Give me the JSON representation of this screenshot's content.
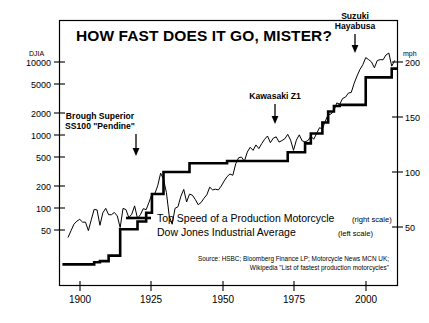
{
  "chart_data": {
    "type": "line",
    "title": "HOW FAST DOES IT GO, MISTER?",
    "xlabel": "",
    "ylabel": "DJIA",
    "y2label": "mph",
    "grid": false,
    "legend_position": "center",
    "x_ticks": [
      "1900",
      "1925",
      "1950",
      "1975",
      "2000"
    ],
    "x_tick_values": [
      1900,
      1925,
      1950,
      1975,
      2000
    ],
    "xlim": [
      1893,
      2010
    ],
    "left_axis": {
      "label": "DJIA",
      "scale": "log",
      "ylim": [
        30,
        13500
      ],
      "ticks": [
        "10000",
        "5000",
        "2000",
        "1000",
        "500",
        "200",
        "100",
        "50"
      ],
      "tick_values": [
        10000,
        5000,
        2000,
        1000,
        500,
        200,
        100,
        50
      ]
    },
    "right_axis": {
      "label": "mph",
      "scale": "linear",
      "ylim": [
        0,
        215
      ],
      "ticks": [
        "200",
        "150",
        "100",
        "50"
      ],
      "tick_values": [
        200,
        150,
        100,
        50
      ]
    },
    "series": [
      {
        "name": "Top Speed of a Production Motorcycle",
        "scale_ref": "right",
        "units": "mph",
        "style": "thick-step",
        "x": [
          1894,
          1900,
          1905,
          1907,
          1910,
          1912,
          1914,
          1920,
          1923,
          1925,
          1929,
          1936,
          1938,
          1949,
          1951,
          1969,
          1972,
          1973,
          1978,
          1980,
          1984,
          1986,
          1988,
          1990,
          1996,
          1999,
          2005,
          2008
        ],
        "values": [
          16,
          16,
          18,
          19,
          24,
          24,
          48,
          55,
          63,
          80,
          100,
          100,
          108,
          108,
          110,
          110,
          118,
          118,
          126,
          135,
          145,
          155,
          160,
          161,
          161,
          186,
          186,
          194
        ]
      },
      {
        "name": "Dow Jones Industrial Average",
        "scale_ref": "left",
        "units": "index",
        "style": "thin-line",
        "x": [
          1896,
          1897,
          1898,
          1899,
          1900,
          1901,
          1902,
          1903,
          1904,
          1905,
          1906,
          1907,
          1908,
          1909,
          1910,
          1911,
          1912,
          1913,
          1914,
          1915,
          1916,
          1917,
          1918,
          1919,
          1920,
          1921,
          1922,
          1923,
          1924,
          1925,
          1926,
          1927,
          1928,
          1929,
          1930,
          1931,
          1932,
          1933,
          1934,
          1935,
          1936,
          1937,
          1938,
          1939,
          1940,
          1941,
          1942,
          1943,
          1944,
          1945,
          1946,
          1947,
          1948,
          1949,
          1950,
          1951,
          1952,
          1953,
          1954,
          1955,
          1956,
          1957,
          1958,
          1959,
          1960,
          1961,
          1962,
          1963,
          1964,
          1965,
          1966,
          1967,
          1968,
          1969,
          1970,
          1971,
          1972,
          1973,
          1974,
          1975,
          1976,
          1977,
          1978,
          1979,
          1980,
          1981,
          1982,
          1983,
          1984,
          1985,
          1986,
          1987,
          1988,
          1989,
          1990,
          1991,
          1992,
          1993,
          1994,
          1995,
          1996,
          1997,
          1998,
          1999,
          2000,
          2001,
          2002,
          2003,
          2004,
          2005,
          2006,
          2007,
          2008,
          2009
        ],
        "values": [
          40,
          49,
          60,
          66,
          70,
          64,
          64,
          49,
          69,
          96,
          94,
          58,
          86,
          99,
          81,
          81,
          87,
          78,
          54,
          99,
          95,
          74,
          82,
          107,
          72,
          81,
          98,
          95,
          120,
          156,
          157,
          202,
          300,
          248,
          164,
          77,
          60,
          99,
          104,
          144,
          180,
          121,
          155,
          150,
          131,
          111,
          119,
          136,
          152,
          193,
          177,
          181,
          177,
          200,
          235,
          269,
          292,
          281,
          404,
          488,
          499,
          436,
          584,
          679,
          616,
          731,
          652,
          763,
          874,
          969,
          786,
          905,
          944,
          800,
          839,
          890,
          1020,
          851,
          616,
          852,
          1005,
          831,
          805,
          839,
          964,
          875,
          1047,
          1259,
          1212,
          1547,
          1896,
          1939,
          2169,
          2753,
          2634,
          3169,
          3301,
          3754,
          3834,
          5117,
          6448,
          7908,
          9181,
          11497,
          10787,
          10022,
          8342,
          10454,
          10783,
          10718,
          12463,
          13265,
          8776,
          10428
        ]
      }
    ],
    "annotations": [
      {
        "label_line1": "Brough Superior",
        "label_line2": "SS100 \"Pendine\"",
        "points_to_year": 1929,
        "points_to_value": 100
      },
      {
        "label_line1": "Kawasaki Z1",
        "label_line2": "",
        "points_to_year": 1973,
        "points_to_value": 118
      },
      {
        "label_line1": "Suzuki",
        "label_line2": "Hayabusa",
        "points_to_year": 1999,
        "points_to_value": 186
      }
    ]
  },
  "chart": {
    "title": "HOW FAST DOES IT GO, MISTER?",
    "left_axis_unit": "DJIA",
    "right_axis_unit": "mph",
    "left_ticks": [
      "10000",
      "5000",
      "2000",
      "1000",
      "500",
      "200",
      "100",
      "50"
    ],
    "right_ticks": [
      "200",
      "150",
      "100",
      "50"
    ],
    "x_ticks": [
      "1900",
      "1925",
      "1950",
      "1975",
      "2000"
    ],
    "annotations": {
      "brough_line1": "Brough Superior",
      "brough_line2": "SS100 \"Pendine\"",
      "kawasaki": "Kawasaki Z1",
      "suzuki_line1": "Suzuki",
      "suzuki_line2": "Hayabusa"
    },
    "legend": {
      "speed_label": "Top Speed of a Production Motorcycle",
      "speed_scale": "(right scale)",
      "djia_label": "Dow Jones Industrial Average",
      "djia_scale": "(left scale)"
    },
    "source_line1": "Source: HSBC; Bloomberg Finance LP; Motorcycle News MCN UK;",
    "source_line2": "Wikipedia \"List of fastest production motorcycles\"",
    "colors": {
      "ink": "#000000",
      "background": "#ffffff"
    }
  }
}
